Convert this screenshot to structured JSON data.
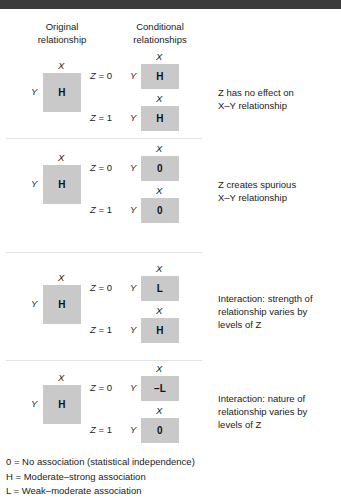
{
  "figure": {
    "headers": {
      "original": "Original\nrelationship",
      "conditional": "Conditional\nrelationships"
    },
    "axis": {
      "x": "X",
      "y": "Y"
    },
    "conditions": {
      "z0": "Z = 0",
      "z1": "Z = 1"
    },
    "blocks": [
      {
        "id": "no-effect",
        "original_value": "H",
        "z0_value": "H",
        "z1_value": "H",
        "description": "Z has no effect on\nX–Y relationship"
      },
      {
        "id": "spurious",
        "original_value": "H",
        "z0_value": "0",
        "z1_value": "0",
        "description": "Z creates spurious\nX–Y relationship"
      },
      {
        "id": "interaction-strength",
        "original_value": "H",
        "z0_value": "L",
        "z1_value": "H",
        "description": "Interaction: strength of\nrelationship varies by\nlevels of Z"
      },
      {
        "id": "interaction-nature",
        "original_value": "H",
        "z0_value": "–L",
        "z1_value": "0",
        "description": "Interaction: nature of\nrelationship varies by\nlevels of Z"
      }
    ],
    "key": [
      "0 = No association (statistical independence)",
      "H = Moderate–strong association",
      "L = Weak–moderate association"
    ],
    "colors": {
      "cell_fill": "#c9c9c9",
      "top_bar": "#3b3b3b",
      "separator": "#e3e3e3",
      "text": "#1b1b1b"
    }
  }
}
